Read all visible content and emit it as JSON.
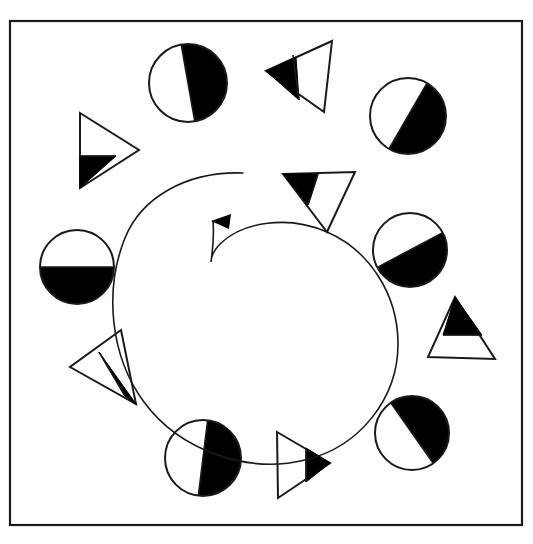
{
  "figure": {
    "canvas": {
      "width": 533,
      "height": 544
    },
    "colors": {
      "background": "#ffffff",
      "stroke": "#1a1a1a",
      "fill_black": "#000000",
      "fill_white": "#ffffff"
    },
    "frame": {
      "name": "outer-border-rectangle",
      "x": 10,
      "y": 21,
      "width": 512,
      "height": 504,
      "stroke_width": 2.2
    },
    "spiral_arrow": {
      "name": "counterclockwise-spiral-arrow",
      "direction": "counterclockwise",
      "stroke_width": 1.6,
      "path": "M 243 173 C 186 171 141 198 125 238 C 104 290 110 356 144 402 C 180 451 248 474 305 460 C 360 447 398 398 398 344 C 398 294 369 250 327 232 C 288 215 243 222 221 243 C 214 250 211 257 211 262 C 211 262 211 262 211 262 C 213 248 214 233 213 221",
      "arrowhead": {
        "tip_x": 211,
        "tip_y": 221,
        "points": "211,221 231,214 229,229"
      }
    },
    "circles": [
      {
        "name": "circle-top",
        "cx": 188,
        "cy": 83,
        "r": 39,
        "shaded_side": "left",
        "split_angle_deg": 100,
        "description": "half circle shaded black on the left, split line near vertical tilted clockwise"
      },
      {
        "name": "circle-upper-right",
        "cx": 408,
        "cy": 116,
        "r": 38,
        "shaded_side": "upper-left",
        "split_angle_deg": 60,
        "description": "half circle shaded black on the upper left, split line diagonal"
      },
      {
        "name": "circle-right",
        "cx": 410,
        "cy": 250,
        "r": 37,
        "shaded_side": "upper-left",
        "split_angle_deg": 28,
        "description": "half circle shaded black on the upper left, split line shallow diagonal"
      },
      {
        "name": "circle-lower-right",
        "cx": 412,
        "cy": 433,
        "r": 37,
        "shaded_side": "upper-right",
        "split_angle_deg": 125,
        "description": "half circle shaded black on the upper right, split line diagonal"
      },
      {
        "name": "circle-bottom",
        "cx": 203,
        "cy": 458,
        "r": 38,
        "shaded_side": "right",
        "split_angle_deg": 83,
        "description": "half circle shaded black on the right, split line near vertical"
      },
      {
        "name": "circle-left",
        "cx": 77,
        "cy": 267,
        "r": 37,
        "shaded_side": "bottom",
        "split_angle_deg": 0,
        "description": "half circle shaded black on the bottom, horizontal split line"
      }
    ],
    "triangles": [
      {
        "name": "triangle-top-right-pointing-left",
        "points": "266,71 332,41 324,112",
        "divider": "293,55 299,100",
        "shaded_part": "tip",
        "shaded_points": "266,71 296,57 299,100",
        "description": "left-pointing triangle with black tip at left"
      },
      {
        "name": "triangle-upper-left-pointing-right",
        "points": "80,113 139,150 80,188",
        "divider": "80,156 116,156",
        "shaded_part": "bottom-left",
        "shaded_points": "80,156 116,156 80,188",
        "description": "right-pointing triangle with black lower-left wedge"
      },
      {
        "name": "triangle-inner-right-pointing-down",
        "points": "283,174 355,172 327,232",
        "divider": "318,174 308,205",
        "shaded_part": "left",
        "shaded_points": "283,174 318,174 308,205",
        "description": "down-pointing triangle with black left portion"
      },
      {
        "name": "triangle-right-pointing-up",
        "points": "455,297 495,359 428,357",
        "divider": "443,335 482,335",
        "shaded_part": "top",
        "shaded_points": "455,297 482,335 443,335",
        "description": "up-pointing triangle with black top wedge"
      },
      {
        "name": "triangle-lower-left-pointing-down-right",
        "points": "121,330 70,367 136,404",
        "divider": "99,352 125,396",
        "shaded_part": "bottom-right",
        "shaded_points": "99,352 136,404 125,396",
        "description": "triangle with black lower-right wedge"
      },
      {
        "name": "triangle-bottom-pointing-right",
        "points": "277,432 330,463 278,498",
        "divider": "306,448 306,482",
        "shaded_part": "tip",
        "shaded_points": "306,448 330,463 306,482",
        "description": "right-pointing triangle with black tip at right"
      }
    ],
    "counts": {
      "circles_label": "6 circles",
      "triangles_label": "6 triangles",
      "total_shapes": 12
    }
  }
}
